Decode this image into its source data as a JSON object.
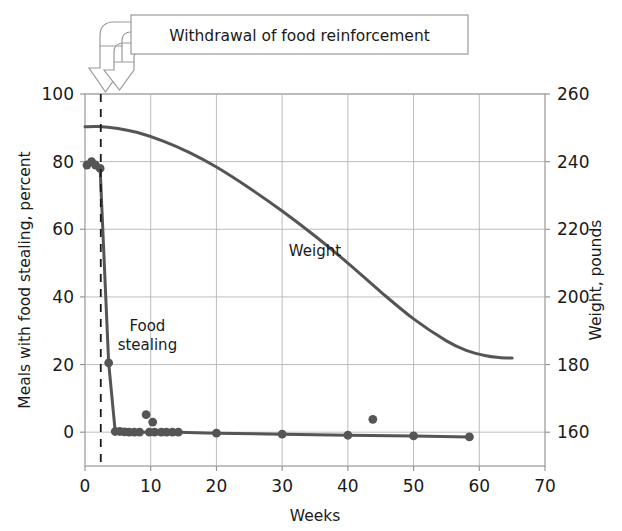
{
  "chart_data": {
    "type": "line",
    "title": "",
    "xlabel": "Weeks",
    "ylabel_left": "Meals with food stealing, percent",
    "ylabel_right": "Weight, pounds",
    "xlim": [
      0,
      70
    ],
    "xticks": [
      0,
      10,
      20,
      30,
      40,
      50,
      60,
      70
    ],
    "xtick_labels": [
      "0",
      "10",
      "20",
      "30",
      "40",
      "50",
      "60",
      "70"
    ],
    "ylim_left": [
      -10,
      100
    ],
    "yticks_left": [
      0,
      20,
      40,
      60,
      80,
      100
    ],
    "ytick_labels_left": [
      "0",
      "20",
      "40",
      "60",
      "80",
      "100"
    ],
    "ylim_right": [
      150,
      260
    ],
    "yticks_right": [
      160,
      180,
      200,
      220,
      240,
      260
    ],
    "ytick_labels_right": [
      "160",
      "180",
      "200",
      "220",
      "240",
      "260"
    ],
    "grid": true,
    "legend": "inline-labels",
    "series": [
      {
        "name": "Food stealing",
        "axis": "left",
        "label": "Food stealing",
        "label_x": 9.5,
        "label_y": 30,
        "marker": "circle",
        "color": "#555555",
        "x": [
          0.3,
          1.0,
          1.6,
          2.3,
          3.6,
          4.6,
          5.3,
          6.0,
          6.7,
          7.5,
          8.3,
          9.8,
          10.6,
          11.6,
          12.4,
          13.3,
          14.2,
          20.0,
          30.0,
          40.0,
          50.0,
          58.5
        ],
        "y": [
          79,
          80,
          79,
          78,
          20.5,
          0.2,
          0.2,
          0.1,
          0.0,
          0.0,
          0.0,
          0.0,
          0.0,
          0.0,
          0.0,
          0.0,
          0.0,
          -0.3,
          -0.6,
          -0.9,
          -1.1,
          -1.4
        ]
      },
      {
        "name": "Food stealing outliers",
        "axis": "left",
        "marker": "circle",
        "color": "#555555",
        "line": false,
        "x": [
          9.3,
          10.3,
          43.8
        ],
        "y": [
          5.2,
          3.0,
          3.8
        ]
      },
      {
        "name": "Weight",
        "axis": "right",
        "label": "Weight",
        "label_x": 35.0,
        "label_y": 212,
        "marker": "none",
        "color": "#555555",
        "x": [
          0.0,
          2.0,
          5.0,
          8.0,
          12.0,
          16.0,
          20.0,
          25.0,
          30.0,
          35.0,
          40.0,
          45.0,
          50.0,
          55.0,
          58.0,
          61.0,
          63.0,
          65.0
        ],
        "y": [
          250.3,
          250.4,
          249.8,
          248.6,
          246.0,
          242.6,
          238.4,
          232.2,
          225.4,
          218.0,
          210.0,
          201.5,
          193.5,
          187.0,
          184.2,
          182.6,
          182.1,
          181.9
        ]
      }
    ],
    "annotations": {
      "vertical_line": {
        "label": "withdrawal-marker",
        "x": 2.4,
        "style": "dashed",
        "color": "#1a1a1a"
      },
      "callout": {
        "text": "Withdrawal of food reinforcement",
        "arrows": 2,
        "arrow_target_x": 2.4
      }
    },
    "colors": {
      "line": "#555555",
      "grid": "#b6b6b6",
      "frame": "#8e8e8e",
      "text": "#1a1a1a",
      "callout_border": "#9a9a9a",
      "arrow_fill": "#ffffff",
      "arrow_stroke": "#9a9a9a"
    }
  }
}
